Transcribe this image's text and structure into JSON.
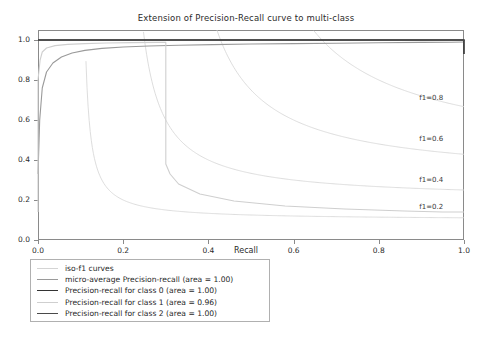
{
  "chart_data": {
    "type": "line",
    "title": "Extension of Precision-Recall curve to multi-class",
    "xlabel": "Recall",
    "ylabel": "Precision",
    "xlim": [
      0.0,
      1.0
    ],
    "ylim": [
      0.0,
      1.05
    ],
    "grid": false,
    "legend_position": "below-left",
    "xticks": [
      "0.0",
      "0.2",
      "0.4",
      "0.6",
      "0.8",
      "1.0"
    ],
    "xtick_values": [
      0.0,
      0.2,
      0.4,
      0.6,
      0.8,
      1.0
    ],
    "yticks": [
      "0.0",
      "0.2",
      "0.4",
      "0.6",
      "0.8",
      "1.0"
    ],
    "ytick_values": [
      0.0,
      0.2,
      0.4,
      0.6,
      0.8,
      1.0
    ],
    "annotations": [
      {
        "text": "f1=0.2",
        "x": 0.895,
        "y": 0.165
      },
      {
        "text": "f1=0.4",
        "x": 0.895,
        "y": 0.3
      },
      {
        "text": "f1=0.6",
        "x": 0.895,
        "y": 0.505
      },
      {
        "text": "f1=0.8",
        "x": 0.895,
        "y": 0.71
      }
    ],
    "iso_f1_values": [
      0.2,
      0.4,
      0.6,
      0.8
    ],
    "series": [
      {
        "name": "iso-f1 curves",
        "legend_label": "iso-f1 curves",
        "color": "#d4d4d4",
        "width": 0.8,
        "kind": "iso-f1"
      },
      {
        "name": "micro-average Precision-recall",
        "legend_label": "micro-average Precision-recall (area = 1.00)",
        "area": "1.00",
        "color": "#9a9a9a",
        "width": 1.1,
        "x": [
          0.0,
          0.004,
          0.01,
          0.02,
          0.035,
          0.055,
          0.08,
          0.11,
          0.15,
          0.2,
          0.26,
          0.33,
          0.41,
          0.5,
          0.6,
          0.7,
          0.8,
          0.9,
          0.97,
          1.0
        ],
        "y": [
          0.33,
          0.6,
          0.76,
          0.84,
          0.885,
          0.915,
          0.935,
          0.948,
          0.958,
          0.965,
          0.97,
          0.974,
          0.977,
          0.98,
          0.982,
          0.984,
          0.986,
          0.988,
          0.989,
          0.99
        ]
      },
      {
        "name": "Precision-recall for class 0",
        "legend_label": "Precision-recall for class 0 (area = 1.00)",
        "area": "1.00",
        "color": "#333333",
        "width": 1.6,
        "x": [
          0.0,
          1.0,
          1.0
        ],
        "y": [
          1.0,
          1.0,
          0.93
        ]
      },
      {
        "name": "Precision-recall for class 1",
        "legend_label": "Precision-recall for class 1 (area = 0.96)",
        "area": "0.96",
        "color": "#cfcfcf",
        "width": 1.1,
        "x": [
          0.0,
          0.0,
          0.0,
          0.0,
          0.0,
          0.005,
          0.01,
          0.02,
          0.04,
          0.07,
          0.11,
          0.16,
          0.22,
          0.28,
          0.3,
          0.3,
          0.3,
          0.3,
          0.3,
          0.3,
          0.3,
          0.3,
          0.31,
          0.33,
          0.38,
          0.46,
          0.58,
          0.72,
          0.86,
          0.95,
          1.0
        ],
        "y": [
          0.14,
          0.28,
          0.45,
          0.62,
          0.8,
          0.9,
          0.94,
          0.96,
          0.972,
          0.978,
          0.982,
          0.985,
          0.987,
          0.988,
          0.988,
          0.93,
          0.86,
          0.78,
          0.68,
          0.56,
          0.46,
          0.38,
          0.33,
          0.28,
          0.23,
          0.195,
          0.17,
          0.155,
          0.145,
          0.14,
          0.14
        ]
      },
      {
        "name": "Precision-recall for class 2",
        "legend_label": "Precision-recall for class 2 (area = 1.00)",
        "area": "1.00",
        "color": "#4a4a4a",
        "width": 1.4,
        "x": [
          0.0,
          1.0,
          1.0
        ],
        "y": [
          1.0,
          1.0,
          0.995
        ]
      }
    ]
  }
}
